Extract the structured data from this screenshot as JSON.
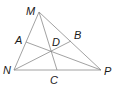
{
  "diagram": {
    "type": "geometry",
    "line_color": "#8a8a8a",
    "label_color": "#1a1a1a",
    "points": {
      "M": {
        "label": "M",
        "x": 39,
        "y": 12
      },
      "N": {
        "label": "N",
        "x": 14,
        "y": 70
      },
      "P": {
        "label": "P",
        "x": 101,
        "y": 70
      },
      "A": {
        "label": "A",
        "x": 26,
        "y": 42
      },
      "B": {
        "label": "B",
        "x": 71,
        "y": 41
      },
      "C": {
        "label": "C",
        "x": 57,
        "y": 70
      },
      "D": {
        "label": "D",
        "x": 51,
        "y": 51
      }
    },
    "segments": [
      [
        "M",
        "N"
      ],
      [
        "N",
        "P"
      ],
      [
        "P",
        "M"
      ],
      [
        "A",
        "P"
      ],
      [
        "B",
        "N"
      ],
      [
        "M",
        "C"
      ]
    ],
    "labels": {
      "M": "M",
      "N": "N",
      "P": "P",
      "A": "A",
      "B": "B",
      "C": "C",
      "D": "D"
    }
  }
}
